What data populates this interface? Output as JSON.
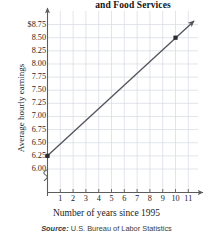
{
  "chart_data": {
    "type": "line",
    "title": "and Food Services",
    "title_note": "title is cropped at top of image; only trailing line visible",
    "xlabel": "Number of years since 1995",
    "ylabel": "Average hourly earnings",
    "source": "Source: U.S. Bureau of Labor Statistics",
    "source_prefix": "Source:",
    "source_body": " U.S. Bureau of Labor Statistics",
    "grid": true,
    "legend": "none",
    "y_axis_break": true,
    "xlim": [
      0,
      11.6
    ],
    "ylim": [
      6.0,
      8.875
    ],
    "x_ticks": [
      1,
      2,
      3,
      4,
      5,
      6,
      7,
      8,
      9,
      10,
      11
    ],
    "x_tick_labels": [
      "1",
      "2",
      "3",
      "4",
      "5",
      "6",
      "7",
      "8",
      "9",
      "10",
      "11"
    ],
    "y_ticks": [
      8.75,
      8.5,
      8.25,
      8.0,
      7.75,
      7.5,
      7.25,
      7.0,
      6.75,
      6.5,
      6.25,
      6.0
    ],
    "y_tick_labels": [
      "$8.75",
      "8.50",
      "8.25",
      "8.00",
      "7.75",
      "7.50",
      "7.25",
      "7.00",
      "6.75",
      "6.50",
      "6.25",
      "6.00"
    ],
    "series": [
      {
        "name": "Average hourly earnings",
        "x": [
          0,
          10
        ],
        "values": [
          6.25,
          8.5
        ],
        "marked_points": [
          {
            "x": 0,
            "y": 6.25
          },
          {
            "x": 10,
            "y": 8.5
          }
        ],
        "line_color": "#555560",
        "marker": "square",
        "arrow_end": true,
        "arrow_extends_to": {
          "x": 11.45,
          "y": 8.82
        }
      }
    ],
    "axis_arrows": {
      "x": "right",
      "y": "up"
    },
    "colors": {
      "grid": "#d7dce3",
      "axis": "#5c5c5c",
      "line": "#55555f",
      "marker": "#2a2a30",
      "text": "#1e1e1e",
      "background": "#ffffff"
    }
  }
}
